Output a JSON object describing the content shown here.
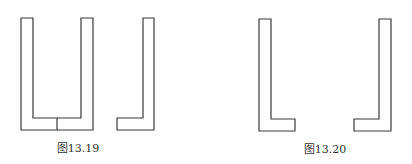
{
  "figures": [
    {
      "id": "fig-13-19",
      "caption": "图13.19",
      "caption_pos": {
        "x": 78,
        "y": 139
      },
      "shapes": [
        {
          "name": "u-shape",
          "points": "21,18 33,18 33,118 81,118 81,18 93,18 93,130 21,130"
        },
        {
          "name": "u-divider",
          "line": [
            57,
            118,
            57,
            130
          ]
        },
        {
          "name": "l-shape-right",
          "points": "143,18 154,18 154,130 117,130 117,118 143,118"
        }
      ]
    },
    {
      "id": "fig-13-20",
      "caption": "图13.20",
      "caption_pos": {
        "x": 325,
        "y": 140
      },
      "shapes": [
        {
          "name": "l-shape-left",
          "points": "259,19 271,19 271,119 295,119 295,131 259,131"
        },
        {
          "name": "l-shape-right",
          "points": "379,19 391,19 391,131 354,131 354,119 379,119"
        }
      ]
    }
  ],
  "style": {
    "stroke": "#3a3a3a",
    "stroke_width": 1.2,
    "background": "#ffffff"
  }
}
